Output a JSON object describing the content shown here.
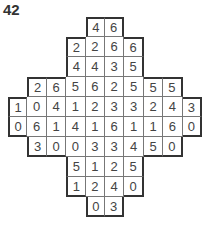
{
  "puzzle": {
    "number": "42",
    "rows": [
      {
        "start": 4,
        "values": [
          "4",
          "6"
        ]
      },
      {
        "start": 3,
        "values": [
          "2",
          "2",
          "6",
          "6"
        ]
      },
      {
        "start": 3,
        "values": [
          "4",
          "4",
          "3",
          "5"
        ]
      },
      {
        "start": 1,
        "values": [
          "2",
          "6",
          "5",
          "6",
          "2",
          "5",
          "5",
          "5"
        ]
      },
      {
        "start": 0,
        "values": [
          "1",
          "0",
          "4",
          "1",
          "2",
          "3",
          "3",
          "2",
          "4",
          "3"
        ]
      },
      {
        "start": 0,
        "values": [
          "0",
          "6",
          "1",
          "4",
          "1",
          "6",
          "1",
          "1",
          "6",
          "0"
        ]
      },
      {
        "start": 1,
        "values": [
          "3",
          "0",
          "0",
          "3",
          "3",
          "4",
          "5",
          "0"
        ]
      },
      {
        "start": 3,
        "values": [
          "5",
          "1",
          "2",
          "5"
        ]
      },
      {
        "start": 3,
        "values": [
          "1",
          "2",
          "4",
          "0"
        ]
      },
      {
        "start": 4,
        "values": [
          "0",
          "3"
        ]
      }
    ]
  }
}
